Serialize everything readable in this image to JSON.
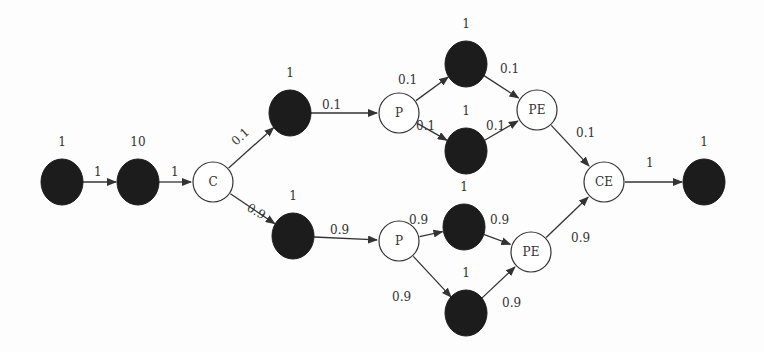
{
  "diagram": {
    "nodes": [
      {
        "id": "n1",
        "type": "dark",
        "label": "",
        "weight": "1",
        "x": 62,
        "y": 182
      },
      {
        "id": "n2",
        "type": "dark",
        "label": "",
        "weight": "10",
        "x": 138,
        "y": 182
      },
      {
        "id": "c",
        "type": "light",
        "label": "C",
        "weight": "",
        "x": 213,
        "y": 182
      },
      {
        "id": "a1",
        "type": "dark",
        "label": "",
        "weight": "1",
        "x": 290,
        "y": 113
      },
      {
        "id": "p1",
        "type": "light",
        "label": "P",
        "weight": "",
        "x": 399,
        "y": 113
      },
      {
        "id": "u1",
        "type": "dark",
        "label": "",
        "weight": "1",
        "x": 466,
        "y": 64
      },
      {
        "id": "u2",
        "type": "dark",
        "label": "",
        "weight": "1",
        "x": 466,
        "y": 151
      },
      {
        "id": "pe1",
        "type": "light",
        "label": "PE",
        "weight": "",
        "x": 537,
        "y": 110
      },
      {
        "id": "ce",
        "type": "light",
        "label": "CE",
        "weight": "",
        "x": 604,
        "y": 182
      },
      {
        "id": "end",
        "type": "dark",
        "label": "",
        "weight": "1",
        "x": 704,
        "y": 182
      },
      {
        "id": "b1",
        "type": "dark",
        "label": "",
        "weight": "1",
        "x": 293,
        "y": 236
      },
      {
        "id": "p2",
        "type": "light",
        "label": "P",
        "weight": "",
        "x": 399,
        "y": 241
      },
      {
        "id": "l1",
        "type": "dark",
        "label": "",
        "weight": "1",
        "x": 464,
        "y": 227
      },
      {
        "id": "l2",
        "type": "dark",
        "label": "",
        "weight": "1",
        "x": 466,
        "y": 313
      },
      {
        "id": "pe2",
        "type": "light",
        "label": "PE",
        "weight": "",
        "x": 531,
        "y": 252
      }
    ],
    "edges": [
      {
        "from": "n1",
        "to": "n2",
        "label": "1",
        "lx": 94,
        "ly": 176
      },
      {
        "from": "n2",
        "to": "c",
        "label": "1",
        "lx": 171,
        "ly": 176
      },
      {
        "from": "c",
        "to": "a1",
        "label": "0.1",
        "lx": 236,
        "ly": 146,
        "rot": -42
      },
      {
        "from": "a1",
        "to": "p1",
        "label": "0.1",
        "lx": 322,
        "ly": 109
      },
      {
        "from": "p1",
        "to": "u1",
        "label": "0.1",
        "lx": 398,
        "ly": 84
      },
      {
        "from": "p1",
        "to": "u2",
        "label": "0.1",
        "lx": 416,
        "ly": 130
      },
      {
        "from": "u1",
        "to": "pe1",
        "label": "0.1",
        "lx": 500,
        "ly": 73
      },
      {
        "from": "u2",
        "to": "pe1",
        "label": "0.1",
        "lx": 486,
        "ly": 130
      },
      {
        "from": "pe1",
        "to": "ce",
        "label": "0.1",
        "lx": 576,
        "ly": 137
      },
      {
        "from": "ce",
        "to": "end",
        "label": "1",
        "lx": 646,
        "ly": 167
      },
      {
        "from": "c",
        "to": "b1",
        "label": "0.9",
        "lx": 246,
        "ly": 210,
        "rot": 30
      },
      {
        "from": "b1",
        "to": "p2",
        "label": "0.9",
        "lx": 330,
        "ly": 234
      },
      {
        "from": "p2",
        "to": "l1",
        "label": "0.9",
        "lx": 409,
        "ly": 224
      },
      {
        "from": "p2",
        "to": "l2",
        "label": "0.9",
        "lx": 392,
        "ly": 301
      },
      {
        "from": "l1",
        "to": "pe2",
        "label": "0.9",
        "lx": 490,
        "ly": 224
      },
      {
        "from": "l2",
        "to": "pe2",
        "label": "0.9",
        "lx": 502,
        "ly": 307
      },
      {
        "from": "pe2",
        "to": "ce",
        "label": "0.9",
        "lx": 571,
        "ly": 242
      }
    ]
  }
}
